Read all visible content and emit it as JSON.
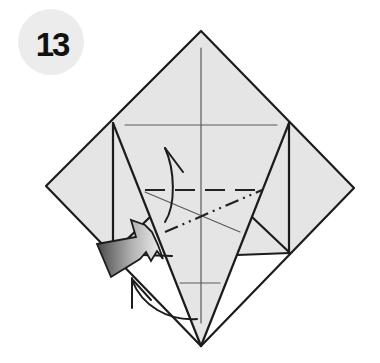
{
  "step": {
    "number": "13"
  },
  "colors": {
    "background": "#ffffff",
    "paper": "#e5e5e5",
    "badge": "#ececec",
    "badge_text": "#111111",
    "edge": "#1c1c1c",
    "crease": "#5a5a5a",
    "push_arrow_dark": "#4a4a4a",
    "push_arrow_light": "#f2f2f2"
  },
  "diagram": {
    "fold_lines": [
      {
        "type": "valley-fold",
        "style": "dashed",
        "orientation": "horizontal"
      },
      {
        "type": "mountain-fold",
        "style": "dash-dot-dot",
        "orientation": "diagonal"
      }
    ],
    "creases": [
      {
        "type": "crease",
        "orientation": "vertical-center"
      },
      {
        "type": "crease",
        "orientation": "horizontal-upper"
      },
      {
        "type": "crease",
        "orientation": "diagonal"
      },
      {
        "type": "crease",
        "orientation": "horizontal-lower-tick"
      }
    ],
    "arrows": [
      {
        "type": "fold-up-arrow",
        "direction": "up"
      },
      {
        "type": "push-in-arrow",
        "direction": "right"
      },
      {
        "type": "fold-behind-arrow",
        "direction": "up-left"
      }
    ]
  }
}
